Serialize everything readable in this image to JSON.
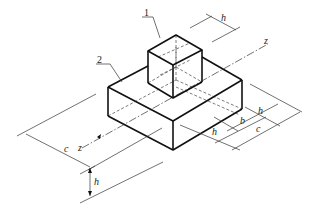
{
  "diagram": {
    "type": "isometric technical drawing",
    "parts": [
      {
        "id": "1",
        "label": "1",
        "description": "cube (h × h × h) on top"
      },
      {
        "id": "2",
        "label": "2",
        "description": "rectangular base block"
      }
    ],
    "axis_label_top": "z",
    "axis_label_bottom": "z",
    "dimensions": {
      "top_h": "h",
      "right_h": "h",
      "right_b": "b",
      "right_c": "c",
      "front_h": "h",
      "left_c": "c",
      "bottom_h": "h"
    },
    "colors": {
      "line": "#1a1a1a",
      "thin": "#333333",
      "background": "#ffffff"
    }
  }
}
